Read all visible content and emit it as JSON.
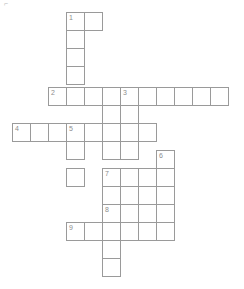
{
  "puzzle": {
    "kind": "crossword-grid",
    "title_mark": "⌐",
    "cell_size": 18,
    "origin": {
      "x": 12,
      "y": 12
    },
    "canvas": {
      "width": 244,
      "height": 289
    },
    "colors": {
      "cell_border": "#9a9a9a",
      "cell_fill": "#ffffff",
      "number_text": "#8d8d8d",
      "page_background": "#ffffff"
    },
    "numbers": [
      "1",
      "2",
      "3",
      "4",
      "5",
      "6",
      "7",
      "8",
      "9"
    ],
    "entries": [
      {
        "number": "1",
        "direction": "across",
        "length": 2,
        "col": 3,
        "row": 0
      },
      {
        "number": "1",
        "direction": "down",
        "length": 5,
        "col": 3,
        "row": 0
      },
      {
        "number": "2",
        "direction": "across",
        "length": 10,
        "col": 2,
        "row": 4
      },
      {
        "number": "3",
        "direction": "down",
        "length": 7,
        "col": 6,
        "row": 4
      },
      {
        "number": "4",
        "direction": "across",
        "length": 8,
        "col": 0,
        "row": 6
      },
      {
        "number": "5",
        "direction": "down",
        "length": 4,
        "col": 3,
        "row": 6
      },
      {
        "number": "6",
        "direction": "down",
        "length": 6,
        "col": 8,
        "row": 8
      },
      {
        "number": "7",
        "direction": "across",
        "length": 5,
        "col": 5,
        "row": 9
      },
      {
        "number": "8",
        "direction": "across",
        "length": 4,
        "col": 5,
        "row": 11
      },
      {
        "number": "9",
        "direction": "across",
        "length": 6,
        "col": 3,
        "row": 12
      },
      {
        "number": "5",
        "direction": "down-extra",
        "length": 9,
        "col": 5,
        "row": 4
      }
    ],
    "cells": [
      {
        "x": 66,
        "y": 12,
        "number": "1"
      },
      {
        "x": 84,
        "y": 12,
        "number": ""
      },
      {
        "x": 66,
        "y": 30,
        "number": ""
      },
      {
        "x": 66,
        "y": 48,
        "number": ""
      },
      {
        "x": 66,
        "y": 66,
        "number": ""
      },
      {
        "x": 48,
        "y": 87,
        "number": "2"
      },
      {
        "x": 66,
        "y": 87,
        "number": ""
      },
      {
        "x": 84,
        "y": 87,
        "number": ""
      },
      {
        "x": 102,
        "y": 87,
        "number": ""
      },
      {
        "x": 120,
        "y": 87,
        "number": "3"
      },
      {
        "x": 138,
        "y": 87,
        "number": ""
      },
      {
        "x": 156,
        "y": 87,
        "number": ""
      },
      {
        "x": 174,
        "y": 87,
        "number": ""
      },
      {
        "x": 192,
        "y": 87,
        "number": ""
      },
      {
        "x": 210,
        "y": 87,
        "number": ""
      },
      {
        "x": 102,
        "y": 105,
        "number": ""
      },
      {
        "x": 120,
        "y": 105,
        "number": ""
      },
      {
        "x": 12,
        "y": 123,
        "number": "4"
      },
      {
        "x": 30,
        "y": 123,
        "number": ""
      },
      {
        "x": 48,
        "y": 123,
        "number": ""
      },
      {
        "x": 66,
        "y": 123,
        "number": "5"
      },
      {
        "x": 84,
        "y": 123,
        "number": ""
      },
      {
        "x": 102,
        "y": 123,
        "number": ""
      },
      {
        "x": 120,
        "y": 123,
        "number": ""
      },
      {
        "x": 138,
        "y": 123,
        "number": ""
      },
      {
        "x": 66,
        "y": 141,
        "number": ""
      },
      {
        "x": 102,
        "y": 141,
        "number": ""
      },
      {
        "x": 120,
        "y": 141,
        "number": ""
      },
      {
        "x": 156,
        "y": 150,
        "number": "6"
      },
      {
        "x": 66,
        "y": 168,
        "number": ""
      },
      {
        "x": 102,
        "y": 168,
        "number": "7"
      },
      {
        "x": 120,
        "y": 168,
        "number": ""
      },
      {
        "x": 138,
        "y": 168,
        "number": ""
      },
      {
        "x": 156,
        "y": 168,
        "number": ""
      },
      {
        "x": 102,
        "y": 186,
        "number": ""
      },
      {
        "x": 120,
        "y": 186,
        "number": ""
      },
      {
        "x": 156,
        "y": 186,
        "number": ""
      },
      {
        "x": 102,
        "y": 204,
        "number": "8"
      },
      {
        "x": 120,
        "y": 204,
        "number": ""
      },
      {
        "x": 138,
        "y": 204,
        "number": ""
      },
      {
        "x": 156,
        "y": 204,
        "number": ""
      },
      {
        "x": 66,
        "y": 222,
        "number": "9"
      },
      {
        "x": 84,
        "y": 222,
        "number": ""
      },
      {
        "x": 102,
        "y": 222,
        "number": ""
      },
      {
        "x": 120,
        "y": 222,
        "number": ""
      },
      {
        "x": 138,
        "y": 222,
        "number": ""
      },
      {
        "x": 156,
        "y": 222,
        "number": ""
      },
      {
        "x": 102,
        "y": 240,
        "number": ""
      },
      {
        "x": 102,
        "y": 258,
        "number": ""
      }
    ]
  }
}
